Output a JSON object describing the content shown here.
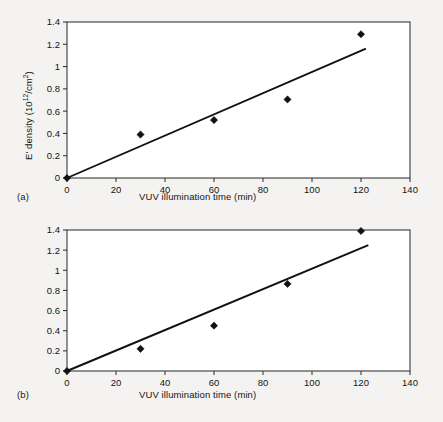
{
  "figure": {
    "panels": [
      {
        "id": "a",
        "panel_label": "(a)",
        "xlabel": "VUV illumination time (min)",
        "ylabel_prefix": "E' density (10",
        "ylabel_exp": "12",
        "ylabel_mid": "/cm",
        "ylabel_exp2": "2",
        "ylabel_suffix": ")",
        "xticks": [
          "0",
          "20",
          "40",
          "60",
          "80",
          "100",
          "120",
          "140"
        ],
        "yticks": [
          "0",
          "0.2",
          "0.4",
          "0.6",
          "0.8",
          "1",
          "1.2",
          "1.4"
        ]
      },
      {
        "id": "b",
        "panel_label": "(b)",
        "xlabel": "VUV illumination time (min)",
        "ylabel_prefix": "Current density (10",
        "ylabel_exp": "−8",
        "ylabel_mid": " A/cm",
        "ylabel_exp2": "2",
        "ylabel_suffix": ")",
        "xticks": [
          "0",
          "20",
          "40",
          "60",
          "80",
          "100",
          "120",
          "140"
        ],
        "yticks": [
          "0",
          "0.2",
          "0.4",
          "0.6",
          "0.8",
          "1",
          "1.2",
          "1.4"
        ]
      }
    ]
  },
  "chart_data": [
    {
      "type": "scatter",
      "panel": "(a)",
      "title": "",
      "xlabel": "VUV illumination time (min)",
      "ylabel": "E' density (10^12/cm^2)",
      "xlim": [
        0,
        140
      ],
      "ylim": [
        0,
        1.4
      ],
      "xtick_values": [
        0,
        20,
        40,
        60,
        80,
        100,
        120,
        140
      ],
      "ytick_values": [
        0,
        0.2,
        0.4,
        0.6,
        0.8,
        1,
        1.2,
        1.4
      ],
      "grid": false,
      "legend": "none",
      "marker": "filled-diamond",
      "series": [
        {
          "name": "E' density",
          "x": [
            0,
            30,
            60,
            90,
            120
          ],
          "values": [
            0.0,
            0.39,
            0.52,
            0.705,
            1.29
          ]
        }
      ],
      "fit_line": {
        "name": "linear fit",
        "x": [
          0,
          122
        ],
        "y": [
          0.0,
          1.16
        ],
        "slope": 0.0095,
        "intercept": 0.0
      }
    },
    {
      "type": "scatter",
      "panel": "(b)",
      "title": "",
      "xlabel": "VUV illumination time (min)",
      "ylabel": "Current density (10^-8 A/cm^2)",
      "xlim": [
        0,
        140
      ],
      "ylim": [
        0,
        1.4
      ],
      "xtick_values": [
        0,
        20,
        40,
        60,
        80,
        100,
        120,
        140
      ],
      "ytick_values": [
        0,
        0.2,
        0.4,
        0.6,
        0.8,
        1,
        1.2,
        1.4
      ],
      "grid": false,
      "legend": "none",
      "marker": "filled-diamond",
      "series": [
        {
          "name": "Current density",
          "x": [
            0,
            30,
            60,
            90,
            120
          ],
          "values": [
            0.0,
            0.22,
            0.45,
            0.865,
            1.39
          ]
        }
      ],
      "fit_line": {
        "name": "linear fit",
        "x": [
          0,
          123
        ],
        "y": [
          0.0,
          1.25
        ],
        "slope": 0.01016,
        "intercept": 0.0
      }
    }
  ]
}
